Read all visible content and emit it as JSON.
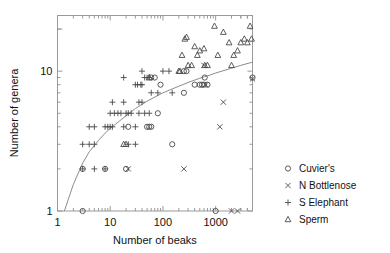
{
  "chart_data": {
    "type": "scatter",
    "title": "",
    "subtitle": "",
    "xlabel": "Number of beaks",
    "ylabel": "Number of genera",
    "xscale": "log",
    "yscale": "log",
    "xlim": [
      1,
      5000
    ],
    "ylim": [
      1,
      25
    ],
    "xticks": [
      1,
      10,
      100,
      1000
    ],
    "xtick_labels": [
      "1",
      "10",
      "100",
      "1000"
    ],
    "yticks": [
      1,
      10
    ],
    "ytick_labels": [
      "1",
      "10"
    ],
    "grid": false,
    "legend_position": "right",
    "annotations": [],
    "fit_curve": {
      "name": "fitted accumulation curve",
      "description": "Rising saturating curve through the data, drawn from (1.35, 1) up to (5000, 11.6)",
      "points": [
        [
          1.35,
          1.0
        ],
        [
          2,
          1.55
        ],
        [
          3,
          2.2
        ],
        [
          4,
          2.65
        ],
        [
          6,
          3.2
        ],
        [
          8,
          3.6
        ],
        [
          10,
          3.9
        ],
        [
          15,
          4.4
        ],
        [
          20,
          4.8
        ],
        [
          30,
          5.4
        ],
        [
          50,
          6.1
        ],
        [
          80,
          6.7
        ],
        [
          100,
          7.0
        ],
        [
          200,
          7.8
        ],
        [
          300,
          8.3
        ],
        [
          500,
          8.9
        ],
        [
          800,
          9.4
        ],
        [
          1000,
          9.7
        ],
        [
          2000,
          10.5
        ],
        [
          3000,
          11.0
        ],
        [
          5000,
          11.6
        ]
      ]
    },
    "series": [
      {
        "name": "Cuvier's",
        "marker": "circle",
        "points": [
          [
            3,
            1
          ],
          [
            3,
            2
          ],
          [
            8,
            2
          ],
          [
            20,
            2
          ],
          [
            22,
            4
          ],
          [
            50,
            4
          ],
          [
            55,
            4
          ],
          [
            60,
            4
          ],
          [
            80,
            5
          ],
          [
            90,
            8
          ],
          [
            60,
            9
          ],
          [
            70,
            9
          ],
          [
            150,
            3
          ],
          [
            250,
            7
          ],
          [
            400,
            8
          ],
          [
            500,
            8
          ],
          [
            550,
            8
          ],
          [
            620,
            9
          ],
          [
            600,
            8
          ],
          [
            700,
            8
          ],
          [
            250,
            10
          ],
          [
            280,
            10
          ],
          [
            1000,
            1
          ],
          [
            5000,
            9
          ]
        ]
      },
      {
        "name": "N Bottlenose",
        "marker": "cross-x",
        "points": [
          [
            22,
            2
          ],
          [
            250,
            2
          ],
          [
            1200,
            4
          ],
          [
            1400,
            6
          ],
          [
            600,
            11
          ],
          [
            650,
            8
          ],
          [
            2000,
            1
          ],
          [
            2600,
            1
          ],
          [
            5000,
            8.8
          ]
        ]
      },
      {
        "name": "S Elephant",
        "marker": "plus",
        "points": [
          [
            3,
            2
          ],
          [
            5,
            2
          ],
          [
            8,
            2
          ],
          [
            3,
            3
          ],
          [
            4,
            3
          ],
          [
            5,
            3
          ],
          [
            22,
            3
          ],
          [
            30,
            3
          ],
          [
            4,
            4
          ],
          [
            5,
            4
          ],
          [
            8,
            4
          ],
          [
            9,
            4
          ],
          [
            10,
            4
          ],
          [
            11,
            4
          ],
          [
            18,
            4
          ],
          [
            30,
            4
          ],
          [
            10,
            5
          ],
          [
            12,
            5
          ],
          [
            14,
            5
          ],
          [
            16,
            5
          ],
          [
            20,
            5
          ],
          [
            22,
            5
          ],
          [
            25,
            5
          ],
          [
            35,
            5
          ],
          [
            45,
            5
          ],
          [
            55,
            5
          ],
          [
            11,
            6
          ],
          [
            18,
            6
          ],
          [
            35,
            6
          ],
          [
            40,
            6
          ],
          [
            30,
            8
          ],
          [
            33,
            8
          ],
          [
            38,
            8
          ],
          [
            40,
            8
          ],
          [
            18,
            9
          ],
          [
            45,
            9
          ],
          [
            50,
            9
          ],
          [
            55,
            9
          ],
          [
            40,
            10
          ],
          [
            100,
            10
          ],
          [
            130,
            10
          ],
          [
            60,
            7
          ],
          [
            80,
            7
          ],
          [
            150,
            7
          ]
        ]
      },
      {
        "name": "Sperm",
        "marker": "triangle",
        "points": [
          [
            18,
            3
          ],
          [
            20,
            3
          ],
          [
            55,
            9
          ],
          [
            200,
            10
          ],
          [
            210,
            10
          ],
          [
            230,
            13
          ],
          [
            260,
            17
          ],
          [
            280,
            17.5
          ],
          [
            400,
            15
          ],
          [
            450,
            13
          ],
          [
            500,
            14
          ],
          [
            600,
            14.5
          ],
          [
            620,
            11
          ],
          [
            700,
            11
          ],
          [
            950,
            21
          ],
          [
            1100,
            13
          ],
          [
            1400,
            19
          ],
          [
            1800,
            16
          ],
          [
            2000,
            11
          ],
          [
            2200,
            13
          ],
          [
            2600,
            14
          ],
          [
            3000,
            16
          ],
          [
            3500,
            17
          ],
          [
            4000,
            16
          ],
          [
            4500,
            21
          ],
          [
            4800,
            17
          ],
          [
            300,
            11
          ],
          [
            350,
            11
          ]
        ]
      }
    ]
  },
  "legend": {
    "items": [
      {
        "label": "Cuvier's",
        "marker": "circle"
      },
      {
        "label": "N Bottlenose",
        "marker": "cross-x"
      },
      {
        "label": "S Elephant",
        "marker": "plus"
      },
      {
        "label": "Sperm",
        "marker": "triangle"
      }
    ]
  }
}
